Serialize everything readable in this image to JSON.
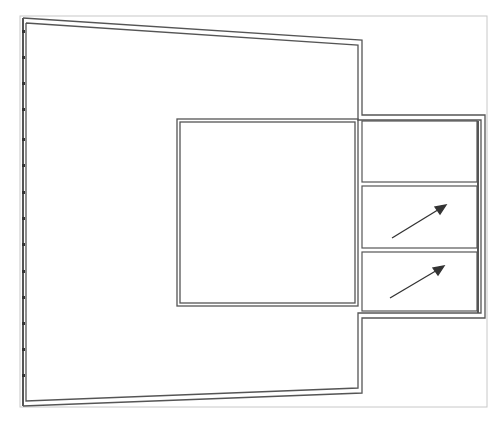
{
  "diagram": {
    "type": "floor-plan-outline",
    "frame": {
      "x": 20,
      "y": 16,
      "w": 467,
      "h": 391,
      "stroke": "#c8c8c8"
    },
    "line_color": "#4a4a4a",
    "left_ticks_count": 14,
    "compartments": 3,
    "arrows": 2,
    "caption": ""
  }
}
